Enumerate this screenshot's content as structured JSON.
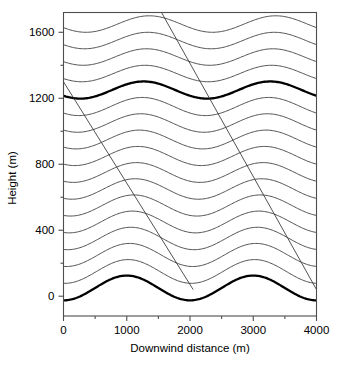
{
  "figure": {
    "background_color": "#ffffff",
    "line_color": "#333333",
    "bold_line_color": "#000000",
    "axis_color": "#4d4d4d"
  },
  "axes": {
    "x_title": "Downwind distance (m)",
    "y_title": "Height (m)",
    "x_ticks": [
      "0",
      "1000",
      "2000",
      "3000",
      "4000"
    ],
    "y_ticks": [
      "0",
      "400",
      "800",
      "1200",
      "1600"
    ]
  },
  "chart_data": {
    "type": "line",
    "title": "",
    "xlabel": "Downwind distance (m)",
    "ylabel": "Height (m)",
    "xlim": [
      0,
      4000
    ],
    "ylim": [
      -120,
      1720
    ],
    "xticks": [
      0,
      1000,
      2000,
      3000,
      4000
    ],
    "yticks": [
      0,
      400,
      800,
      1200,
      1600
    ],
    "minor_ytick_interval": 200,
    "minor_xtick_interval": 500,
    "grid": false,
    "legend": false,
    "wave": {
      "wavelength_m": 2000,
      "phase_x0_m": 0,
      "amplitude_at_surface_m": 75,
      "amplitude_aloft_m": 50,
      "vertical_phase_shift_per_1000m_deg": -40
    },
    "series": [
      {
        "name": "streamline-0",
        "base_height_m": 50,
        "emphasis": "bold",
        "amplitude_m": 75,
        "phase_deg": 0
      },
      {
        "name": "streamline-1",
        "base_height_m": 150,
        "emphasis": "normal",
        "amplitude_m": 72,
        "phase_deg": -4
      },
      {
        "name": "streamline-2",
        "base_height_m": 250,
        "emphasis": "normal",
        "amplitude_m": 70,
        "phase_deg": -8
      },
      {
        "name": "streamline-3",
        "base_height_m": 350,
        "emphasis": "normal",
        "amplitude_m": 68,
        "phase_deg": -12
      },
      {
        "name": "streamline-4",
        "base_height_m": 450,
        "emphasis": "normal",
        "amplitude_m": 66,
        "phase_deg": -16
      },
      {
        "name": "streamline-5",
        "base_height_m": 550,
        "emphasis": "normal",
        "amplitude_m": 64,
        "phase_deg": -20
      },
      {
        "name": "streamline-6",
        "base_height_m": 650,
        "emphasis": "normal",
        "amplitude_m": 62,
        "phase_deg": -24
      },
      {
        "name": "streamline-7",
        "base_height_m": 750,
        "emphasis": "normal",
        "amplitude_m": 60,
        "phase_deg": -28
      },
      {
        "name": "streamline-8",
        "base_height_m": 850,
        "emphasis": "normal",
        "amplitude_m": 58,
        "phase_deg": -32
      },
      {
        "name": "streamline-9",
        "base_height_m": 950,
        "emphasis": "normal",
        "amplitude_m": 57,
        "phase_deg": -36
      },
      {
        "name": "streamline-10",
        "base_height_m": 1050,
        "emphasis": "normal",
        "amplitude_m": 56,
        "phase_deg": -40
      },
      {
        "name": "streamline-11",
        "base_height_m": 1150,
        "emphasis": "normal",
        "amplitude_m": 55,
        "phase_deg": -44
      },
      {
        "name": "streamline-12",
        "base_height_m": 1250,
        "emphasis": "bold",
        "amplitude_m": 52,
        "phase_deg": -48
      },
      {
        "name": "streamline-13",
        "base_height_m": 1350,
        "emphasis": "normal",
        "amplitude_m": 50,
        "phase_deg": -52
      },
      {
        "name": "streamline-14",
        "base_height_m": 1450,
        "emphasis": "normal",
        "amplitude_m": 50,
        "phase_deg": -56
      },
      {
        "name": "streamline-15",
        "base_height_m": 1550,
        "emphasis": "normal",
        "amplitude_m": 50,
        "phase_deg": -60
      },
      {
        "name": "streamline-16",
        "base_height_m": 1650,
        "emphasis": "normal",
        "amplitude_m": 50,
        "phase_deg": -64
      }
    ],
    "rays": [
      {
        "name": "wave-ray-1",
        "x_start_m": 0,
        "y_start_m": 1300,
        "x_end_m": 2050,
        "y_end_m": 40
      },
      {
        "name": "wave-ray-2",
        "x_start_m": 1550,
        "y_start_m": 1720,
        "x_end_m": 4000,
        "y_end_m": 40
      }
    ]
  }
}
